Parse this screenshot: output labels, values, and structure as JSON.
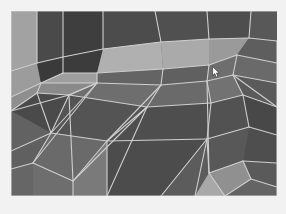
{
  "app": {
    "title": "3D Viewport",
    "view_label": "Perspective",
    "shading_mode": "Wireframe on Shaded"
  },
  "viewport": {
    "name": "mesh-viewport",
    "x": 11,
    "y": 11,
    "width": 266,
    "height": 185,
    "background_color": "#6a6a6a",
    "page_background": "#f2f2f2"
  },
  "cursor": {
    "name": "mouse-cursor",
    "x": 212,
    "y": 66,
    "fill": "#ffffff",
    "stroke": "#3a3a3a"
  },
  "palette": {
    "wire": "#cfcfcf",
    "wire_bright": "#e6e6e6",
    "face_darkest": "#3c3c3c",
    "face_dark": "#4a4a4a",
    "face_mid_dark": "#585858",
    "face_mid": "#666666",
    "face_mid_light": "#747474",
    "face_light": "#8e8e8e",
    "face_lighter": "#a0a0a0",
    "face_lightest": "#b4b4b4"
  },
  "mesh": {
    "description": "Shaded polygonal triangle mesh with wireframe overlay",
    "wire_width": 1.1,
    "faces": [
      {
        "id": "f01",
        "points": "0,0 26,0 26,52 0,60",
        "fill": "#a2a2a2"
      },
      {
        "id": "f02",
        "points": "26,0 52,0 52,46 26,52",
        "fill": "#4a4a4a"
      },
      {
        "id": "f03",
        "points": "52,0 92,0 92,38 52,46",
        "fill": "#3e3e3e"
      },
      {
        "id": "f04",
        "points": "92,0 144,0 150,31 92,38",
        "fill": "#4c4c4c"
      },
      {
        "id": "f05",
        "points": "144,0 196,0 198,28 150,31",
        "fill": "#505050"
      },
      {
        "id": "f06",
        "points": "196,0 240,0 238,27 198,28",
        "fill": "#4e4e4e"
      },
      {
        "id": "f07",
        "points": "240,0 266,0 266,30 238,27",
        "fill": "#585858"
      },
      {
        "id": "f08",
        "points": "0,60 26,52 30,72 0,86",
        "fill": "#9c9c9c"
      },
      {
        "id": "f09",
        "points": "26,52 52,46 52,62 30,72",
        "fill": "#3a3a3a"
      },
      {
        "id": "f10",
        "points": "52,46 92,38 86,62 52,62",
        "fill": "#3c3c3c"
      },
      {
        "id": "f11",
        "points": "52,62 86,62 86,72 30,72",
        "fill": "#9e9e9e"
      },
      {
        "id": "f12",
        "points": "92,38 150,31 152,58 86,62",
        "fill": "#b0b0b0"
      },
      {
        "id": "f13",
        "points": "150,31 198,28 198,54 152,58",
        "fill": "#aaaaaa"
      },
      {
        "id": "f14",
        "points": "198,28 238,27 226,44 198,54",
        "fill": "#9a9a9a"
      },
      {
        "id": "f15",
        "points": "238,27 266,30 266,52 226,44",
        "fill": "#5e5e5e"
      },
      {
        "id": "f16",
        "points": "226,44 266,52 266,72 222,64",
        "fill": "#6a6a6a"
      },
      {
        "id": "f17",
        "points": "198,54 226,44 222,64 196,70",
        "fill": "#6e6e6e"
      },
      {
        "id": "f18",
        "points": "86,62 152,58 150,74 86,72",
        "fill": "#646464"
      },
      {
        "id": "f19",
        "points": "152,58 198,54 196,70 150,74",
        "fill": "#606060"
      },
      {
        "id": "f20",
        "points": "86,72 150,74 136,96 58,84",
        "fill": "#6e6e6e"
      },
      {
        "id": "f21",
        "points": "150,74 196,70 200,92 136,96",
        "fill": "#6a6a6a"
      },
      {
        "id": "f22",
        "points": "196,70 222,64 232,84 200,92",
        "fill": "#727272"
      },
      {
        "id": "f23",
        "points": "222,64 266,72 266,96 232,84",
        "fill": "#5a5a5a"
      },
      {
        "id": "f24",
        "points": "30,72 86,72 58,84 26,82",
        "fill": "#8a8a8a"
      },
      {
        "id": "f25",
        "points": "0,86 30,72 26,82 0,100",
        "fill": "#8e8e8e"
      },
      {
        "id": "f26",
        "points": "0,100 26,82 58,84 40,122",
        "fill": "#4a4a4a"
      },
      {
        "id": "f27",
        "points": "58,84 136,96 96,130 40,122",
        "fill": "#545454"
      },
      {
        "id": "f28",
        "points": "136,96 200,92 196,128 96,130",
        "fill": "#4e4e4e"
      },
      {
        "id": "f29",
        "points": "200,92 232,84 238,116 196,128",
        "fill": "#525252"
      },
      {
        "id": "f30",
        "points": "232,84 266,96 266,124 238,116",
        "fill": "#484848"
      },
      {
        "id": "f31",
        "points": "0,100 40,122 0,140",
        "fill": "#626262"
      },
      {
        "id": "f32",
        "points": "40,122 96,130 62,170 22,152",
        "fill": "#6a6a6a"
      },
      {
        "id": "f33",
        "points": "0,140 40,122 22,152 0,158",
        "fill": "#606060"
      },
      {
        "id": "f34",
        "points": "96,130 196,128 150,185 96,185",
        "fill": "#4c4c4c"
      },
      {
        "id": "f35",
        "points": "62,170 96,130 96,185 62,185",
        "fill": "#7a7a7a"
      },
      {
        "id": "f36",
        "points": "22,152 62,170 62,185 22,185",
        "fill": "#6e6e6e"
      },
      {
        "id": "f37",
        "points": "0,158 22,152 22,185 0,185",
        "fill": "#666666"
      },
      {
        "id": "f38",
        "points": "196,128 238,116 232,150 198,162",
        "fill": "#585858"
      },
      {
        "id": "f39",
        "points": "238,116 266,124 266,152 232,150",
        "fill": "#4e4e4e"
      },
      {
        "id": "f40",
        "points": "150,185 196,128 198,162 184,185",
        "fill": "#5c5c5c"
      },
      {
        "id": "f41",
        "points": "198,162 232,150 240,168 214,185",
        "fill": "#909090"
      },
      {
        "id": "f42",
        "points": "184,185 198,162 214,185",
        "fill": "#a8a8a8"
      },
      {
        "id": "f43",
        "points": "232,150 266,152 266,176 240,168",
        "fill": "#5a5a5a"
      },
      {
        "id": "f44",
        "points": "240,168 266,176 266,185 214,185",
        "fill": "#646464"
      }
    ],
    "edges": [
      "26,0 26,52",
      "52,0 52,62",
      "92,0 92,38",
      "144,0 150,31",
      "196,0 198,28",
      "240,0 238,27",
      "0,60 26,52",
      "26,52 52,46",
      "52,46 92,38",
      "92,38 150,31",
      "150,31 198,28",
      "198,28 238,27",
      "238,27 266,30",
      "0,86 30,72",
      "30,72 52,62",
      "52,62 86,62",
      "86,62 152,58",
      "152,58 198,54",
      "198,54 226,44",
      "226,44 266,52",
      "30,72 86,72",
      "86,72 150,74",
      "150,74 196,70",
      "196,70 222,64",
      "222,64 266,72",
      "86,62 86,72",
      "152,58 150,74",
      "198,54 196,70",
      "226,44 222,64",
      "0,100 26,82",
      "26,82 58,84",
      "58,84 136,96",
      "136,96 200,92",
      "200,92 232,84",
      "232,84 266,96",
      "26,82 30,72",
      "58,84 86,72",
      "136,96 150,74",
      "200,92 196,70",
      "232,84 222,64",
      "0,140 40,122",
      "40,122 96,130",
      "96,130 196,128",
      "196,128 238,116",
      "238,116 266,124",
      "40,122 58,84",
      "40,122 26,82",
      "96,130 136,96",
      "196,128 200,92",
      "238,116 232,84",
      "0,158 22,152",
      "22,152 62,170",
      "22,152 40,122",
      "62,170 96,130",
      "62,170 62,185",
      "96,130 96,185",
      "196,128 150,185",
      "196,128 184,185",
      "198,162 232,150",
      "232,150 266,152",
      "198,162 196,128",
      "198,162 214,185",
      "240,168 232,150",
      "240,168 214,185",
      "240,168 266,176",
      "86,72 40,122",
      "86,72 22,152",
      "150,74 96,130",
      "196,70 198,162",
      "222,64 266,96",
      "58,84 0,100",
      "86,72 58,84",
      "58,84 62,170",
      "136,96 96,185",
      "136,96 62,170",
      "266,30 266,185",
      "0,0 266,0",
      "0,0 0,185",
      "0,185 266,185"
    ]
  }
}
